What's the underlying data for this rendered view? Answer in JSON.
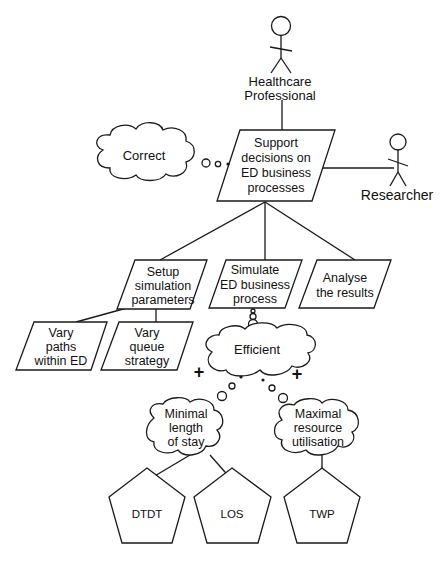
{
  "diagram": {
    "type": "goal-model",
    "colors": {
      "stroke": "#1a1a1a",
      "background": "#ffffff",
      "text": "#111111"
    },
    "actors": [
      {
        "id": "healthcare-professional",
        "label_line1": "Healthcare",
        "label_line2": "Professional"
      },
      {
        "id": "researcher",
        "label": "Researcher"
      }
    ],
    "goals": {
      "main": {
        "lines": [
          "Support",
          "decisions on",
          "ED business",
          "processes"
        ]
      },
      "setup": {
        "lines": [
          "Setup",
          "simulation",
          "parameters"
        ]
      },
      "simulate": {
        "lines": [
          "Simulate",
          "ED business",
          "process"
        ]
      },
      "analyse": {
        "lines": [
          "Analyse",
          "the results"
        ]
      },
      "vary_paths": {
        "lines": [
          "Vary",
          "paths",
          "within ED"
        ]
      },
      "vary_queue": {
        "lines": [
          "Vary",
          "queue",
          "strategy"
        ]
      }
    },
    "softgoals": {
      "correct": {
        "label": "Correct"
      },
      "efficient": {
        "label": "Efficient"
      },
      "minimal_los": {
        "lines": [
          "Minimal",
          "length",
          "of stay"
        ]
      },
      "maximal_util": {
        "lines": [
          "Maximal",
          "resource",
          "utilisation"
        ]
      }
    },
    "contributions": [
      {
        "from": "minimal_los",
        "to": "efficient",
        "sign": "+"
      },
      {
        "from": "maximal_util",
        "to": "efficient",
        "sign": "+"
      }
    ],
    "indicators": [
      {
        "id": "dtdt",
        "label": "DTDT"
      },
      {
        "id": "los",
        "label": "LOS"
      },
      {
        "id": "twp",
        "label": "TWP"
      }
    ]
  }
}
